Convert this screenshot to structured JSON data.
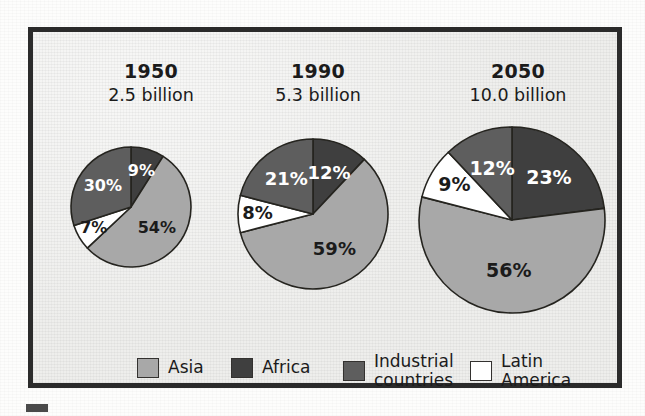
{
  "figure": {
    "background_color": "#eeeeec",
    "frame_color": "#2b2b2b"
  },
  "chart_data": [
    {
      "type": "pie",
      "title": "1950",
      "subtitle": "2.5 billion",
      "categories": [
        "Africa",
        "Asia",
        "Latin America",
        "Industrial countries"
      ],
      "values": [
        9,
        54,
        7,
        30
      ],
      "labels": [
        "9%",
        "54%",
        "7%",
        "30%"
      ],
      "total_population": "2.5 billion",
      "year": "1950",
      "radius_px": 60
    },
    {
      "type": "pie",
      "title": "1990",
      "subtitle": "5.3 billion",
      "categories": [
        "Africa",
        "Asia",
        "Latin America",
        "Industrial countries"
      ],
      "values": [
        12,
        59,
        8,
        21
      ],
      "labels": [
        "12%",
        "59%",
        "8%",
        "21%"
      ],
      "total_population": "5.3 billion",
      "year": "1990",
      "radius_px": 75
    },
    {
      "type": "pie",
      "title": "2050",
      "subtitle": "10.0 billion",
      "categories": [
        "Africa",
        "Asia",
        "Latin America",
        "Industrial countries"
      ],
      "values": [
        23,
        56,
        9,
        12
      ],
      "labels": [
        "23%",
        "56%",
        "9%",
        "12%"
      ],
      "total_population": "10.0 billion",
      "year": "2050",
      "radius_px": 93
    }
  ],
  "series_colors": {
    "Asia": "#a8a8a8",
    "Africa": "#3f3f3f",
    "Industrial countries": "#5e5e5e",
    "Latin America": "#ffffff"
  },
  "legend": {
    "position": "bottom",
    "items": [
      {
        "label": "Asia",
        "color": "#a8a8a8",
        "text_color": "#1b1b1b"
      },
      {
        "label": "Africa",
        "color": "#3f3f3f",
        "text_color": "#1b1b1b"
      },
      {
        "label": "Industrial\ncountries",
        "color": "#5e5e5e",
        "text_color": "#1b1b1b"
      },
      {
        "label": "Latin\nAmerica",
        "color": "#ffffff",
        "text_color": "#1b1b1b"
      }
    ]
  }
}
